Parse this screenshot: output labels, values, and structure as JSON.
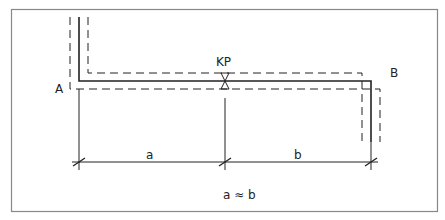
{
  "diagram": {
    "type": "pipe-layout-technical-drawing",
    "labels": {
      "point_a": "A",
      "point_b": "B",
      "valve": "KP",
      "dim_a": "a",
      "dim_b": "b",
      "relation": "a ≈ b"
    },
    "colors": {
      "line": "#222222",
      "frame": "#888888",
      "background": "#ffffff"
    }
  }
}
